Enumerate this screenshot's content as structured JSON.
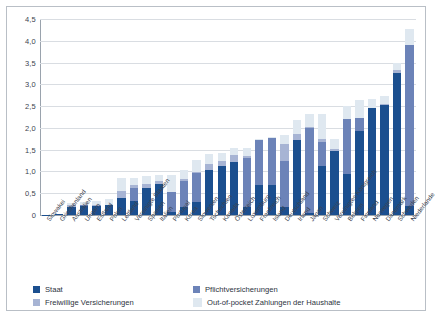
{
  "chart_data": {
    "type": "bar",
    "subtype": "stacked-bar",
    "title": "",
    "subtitle": "",
    "xlabel": "",
    "ylabel": "",
    "ylim": [
      0,
      4.5
    ],
    "ytick_labels": [
      "0",
      "0,5",
      "1,0",
      "1,5",
      "2,0",
      "2,5",
      "3,0",
      "3,5",
      "4,0",
      "4,5"
    ],
    "ytick_values": [
      0,
      0.5,
      1.0,
      1.5,
      2.0,
      2.5,
      3.0,
      3.5,
      4.0,
      4.5
    ],
    "grid": true,
    "grid_axis": "y",
    "legend_position": "bottom-left",
    "categories": [
      "Slowakei",
      "Griechenland",
      "Australien",
      "Ungarn",
      "Estland",
      "Polen",
      "Lettland",
      "Vereinigte Staaten",
      "Spanien",
      "Italien",
      "Portugal",
      "Korea",
      "Slowenien",
      "Tschechien",
      "Kanada",
      "Österreich",
      "Luxemburg",
      "Frankreich",
      "Island",
      "Deutschland",
      "Irland",
      "Japan",
      "Schweiz",
      "Vereinigtes Königreich",
      "Belgien",
      "Finnland",
      "Norwegen",
      "Dänemark",
      "Schweden",
      "Niederlande"
    ],
    "series": [
      {
        "name": "Staat",
        "color": "#1b4f8f",
        "values": [
          0.01,
          0.03,
          0.19,
          0.21,
          0.2,
          0.22,
          0.39,
          0.32,
          0.62,
          0.71,
          0.07,
          0.18,
          0.3,
          1.04,
          1.13,
          1.21,
          0.18,
          0.7,
          0.68,
          0.19,
          1.73,
          0.05,
          1.12,
          1.47,
          0.94,
          1.92,
          2.45,
          2.52,
          3.25,
          0.21
        ]
      },
      {
        "name": "Pflichtversicherungen",
        "color": "#6c83b8",
        "values": [
          0.0,
          0.0,
          0.0,
          0.03,
          0.0,
          0.0,
          0.0,
          0.29,
          0.0,
          0.0,
          0.46,
          0.61,
          0.66,
          0.0,
          0.0,
          0.0,
          1.13,
          1.03,
          1.1,
          1.05,
          0.0,
          1.95,
          0.55,
          0.0,
          1.26,
          0.3,
          0.0,
          0.0,
          0.0,
          3.69
        ]
      },
      {
        "name": "Freiwillige Versicherungen",
        "color": "#a7b4d4",
        "values": [
          0.0,
          0.0,
          0.04,
          0.0,
          0.02,
          0.02,
          0.17,
          0.09,
          0.1,
          0.06,
          0.0,
          0.03,
          0.02,
          0.13,
          0.1,
          0.16,
          0.04,
          0.0,
          0.0,
          0.4,
          0.13,
          0.03,
          0.07,
          0.05,
          0.0,
          0.0,
          0.0,
          0.04,
          0.07,
          0.0
        ]
      },
      {
        "name": "Out-of-pocket Zahlungen der Haushalte",
        "color": "#dfe8f0",
        "values": [
          0.0,
          0.0,
          0.05,
          0.06,
          0.1,
          0.12,
          0.28,
          0.16,
          0.18,
          0.14,
          0.38,
          0.22,
          0.28,
          0.23,
          0.19,
          0.16,
          0.18,
          0.02,
          0.02,
          0.19,
          0.32,
          0.29,
          0.58,
          0.23,
          0.3,
          0.43,
          0.22,
          0.17,
          0.18,
          0.36
        ]
      }
    ]
  },
  "legend": {
    "items": [
      {
        "label": "Staat",
        "color": "#1b4f8f"
      },
      {
        "label": "Pflichtversicherungen",
        "color": "#6c83b8"
      },
      {
        "label": "Freiwillige Versicherungen",
        "color": "#a7b4d4"
      },
      {
        "label": "Out-of-pocket Zahlungen der Haushalte",
        "color": "#dfe8f0"
      }
    ]
  }
}
